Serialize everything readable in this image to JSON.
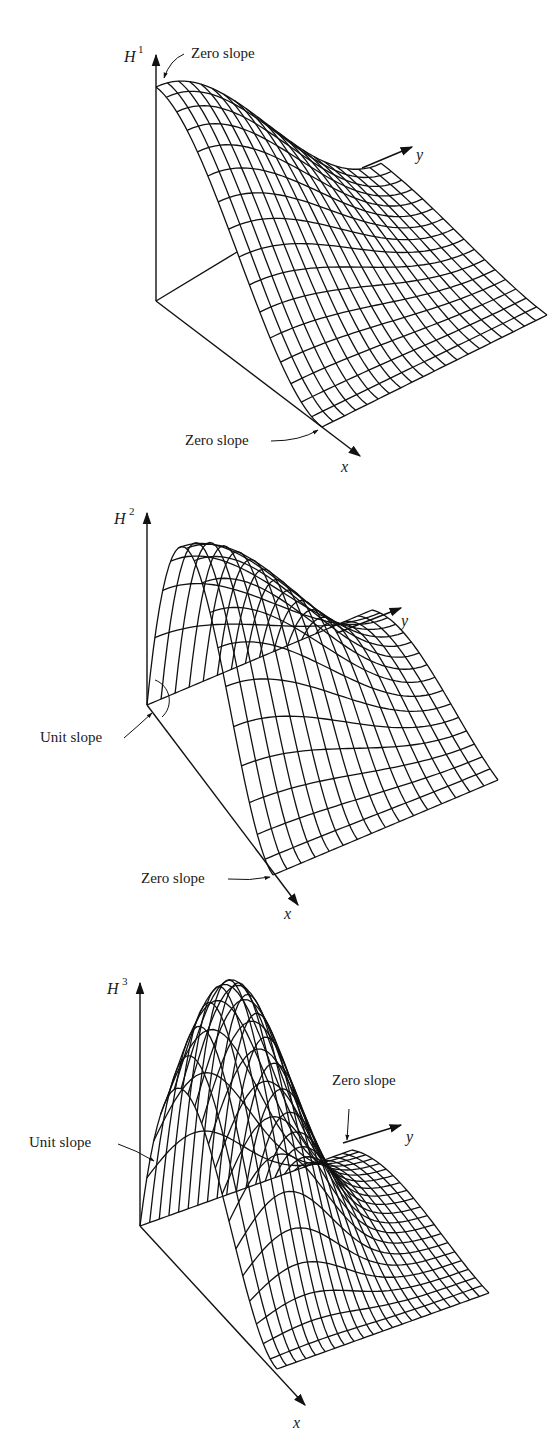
{
  "figures": [
    {
      "id": "H1",
      "axis_labels": {
        "vertical": "H",
        "vertical_superscript": "1",
        "x": "x",
        "y": "y"
      },
      "annotations": [
        {
          "text": "Zero slope",
          "position": "top, at peak on vertical axis"
        },
        {
          "text": "Zero slope",
          "position": "bottom, at x-axis end"
        }
      ]
    },
    {
      "id": "H2",
      "axis_labels": {
        "vertical": "H",
        "vertical_superscript": "2",
        "x": "x",
        "y": "y"
      },
      "annotations": [
        {
          "text": "Unit slope",
          "position": "left, at origin"
        },
        {
          "text": "Zero slope",
          "position": "bottom, at x-axis end"
        }
      ]
    },
    {
      "id": "H3",
      "axis_labels": {
        "vertical": "H",
        "vertical_superscript": "3",
        "x": "x",
        "y": "y"
      },
      "annotations": [
        {
          "text": "Unit slope",
          "position": "left, on front edge"
        },
        {
          "text": "Zero slope",
          "position": "right, at y-axis end"
        }
      ]
    }
  ],
  "colors": {
    "ink": "#111111",
    "paper": "#ffffff"
  }
}
